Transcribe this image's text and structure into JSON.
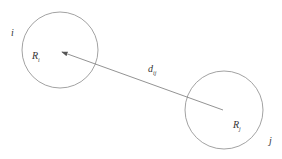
{
  "diagram": {
    "nodes": [
      {
        "id": "i",
        "label": "i",
        "inner_label": "R",
        "inner_sub": "i",
        "cx": 60,
        "cy": 50,
        "r": 38
      },
      {
        "id": "j",
        "label": "j",
        "inner_label": "R",
        "inner_sub": "j",
        "cx": 224,
        "cy": 110,
        "r": 39
      }
    ],
    "edge": {
      "from": "j",
      "to": "i",
      "label": "d",
      "label_sub": "ij",
      "arrow": "to-i"
    },
    "colors": {
      "stroke": "#8a8a8a",
      "text": "#333333"
    }
  }
}
